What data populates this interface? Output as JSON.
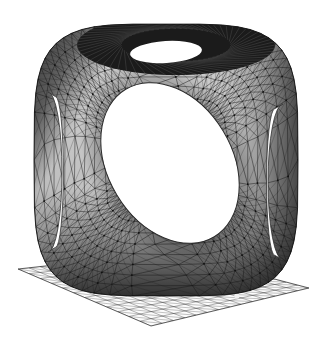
{
  "meta": {
    "render_style": "flat-shaded-wireframe",
    "background_color": "#ffffff",
    "width": 336,
    "height": 339
  },
  "chart_data": {
    "type": "scatter",
    "xlabel": "",
    "ylabel": "",
    "grid": false,
    "legend": null,
    "categories": [],
    "values": []
  },
  "scene": {
    "object": {
      "name": "cube-with-three-holes",
      "description": "Rounded cube solid pierced by three mutually orthogonal cylindrical holes",
      "mesh_type": "irregular triangular surface mesh",
      "edge_color": "#1a1a1a",
      "edge_width": 0.55,
      "shading": {
        "light_face_color": "#bdbdbd",
        "mid_face_color": "#8f8f8f",
        "dark_face_color": "#4a4a4a",
        "darkest_face_color": "#262626",
        "inner_bore_color": "#1c1c1c"
      },
      "center": {
        "x": 166,
        "y": 160
      },
      "half_width": 132,
      "half_height": 136,
      "corner_roundness": 0.34,
      "tessellation_rings": 13,
      "tessellation_segments": 54,
      "front_hole": {
        "name": "front-face-hole",
        "shape": "ellipse",
        "center": {
          "x": 170,
          "y": 163
        },
        "radius_x": 62,
        "radius_y": 86,
        "rotation_deg": -31,
        "fill": "#ffffff",
        "rim_shadow": "#6f6f6f"
      },
      "top_hole": {
        "name": "top-face-hole",
        "shape": "ellipse-annulus",
        "outer_center": {
          "x": 176,
          "y": 45
        },
        "outer_radius_x": 99,
        "outer_radius_y": 30,
        "inner_center": {
          "x": 166,
          "y": 52
        },
        "inner_radius_x": 36,
        "inner_radius_y": 11,
        "bore_fill": "#1b1b1b",
        "inner_fill": "#ffffff"
      },
      "left_hole": {
        "name": "left-face-hole",
        "shape": "crescent",
        "center": {
          "x": 48,
          "y": 172
        },
        "radius_x": 14,
        "radius_y": 80,
        "fill": "#ffffff"
      },
      "right_hole": {
        "name": "right-face-hole",
        "shape": "crescent",
        "center": {
          "x": 283,
          "y": 182
        },
        "radius_x": 15,
        "radius_y": 78,
        "fill": "#ffffff"
      },
      "speck": {
        "name": "render-speck",
        "x": 237,
        "y": 296,
        "radius": 2.6,
        "fill": "#f2f2f2"
      }
    },
    "ground_plane": {
      "name": "ground-plane-grid",
      "description": "Gridded reference plane beneath the object drawn in perspective",
      "corners": [
        {
          "x": 18,
          "y": 269
        },
        {
          "x": 171,
          "y": 252
        },
        {
          "x": 309,
          "y": 288
        },
        {
          "x": 151,
          "y": 326
        }
      ],
      "grid_divisions_u": 14,
      "grid_divisions_v": 12,
      "line_color": "#3c3c3c",
      "line_width": 0.4,
      "fill_color": "#fbfbfb",
      "diagonals": true
    }
  }
}
